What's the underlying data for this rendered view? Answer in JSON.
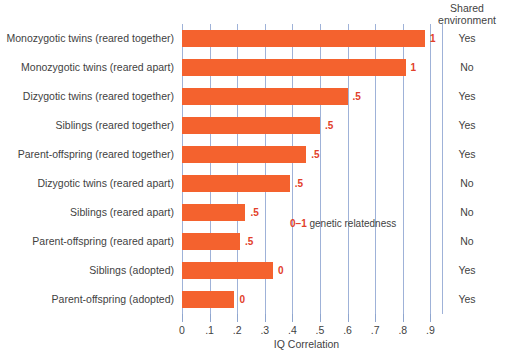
{
  "colors": {
    "bar": "#f4622e",
    "value_label": "#e2402a",
    "gridline": "#9fb2d8",
    "text": "#3f3f3f",
    "background": "#ffffff"
  },
  "header": {
    "shared_environment_label": "Shared\nenvironment",
    "shared_environment_line1": "Shared",
    "shared_environment_line2": "environment"
  },
  "annotation": {
    "prefix_num": "0",
    "dash": "–",
    "suffix_num": "1",
    "text": " genetic relatedness",
    "full": "0 –1 genetic relatedness"
  },
  "axis": {
    "x_title": "IQ Correlation",
    "x_ticks": [
      "0",
      ".1",
      ".2",
      ".3",
      ".4",
      ".5",
      ".6",
      ".7",
      ".8",
      ".9"
    ],
    "x_tick_values": [
      0,
      0.1,
      0.2,
      0.3,
      0.4,
      0.5,
      0.6,
      0.7,
      0.8,
      0.9
    ],
    "x_min": 0,
    "x_max": 0.9
  },
  "chart_data": {
    "type": "bar",
    "orientation": "horizontal",
    "title": "",
    "xlabel": "IQ Correlation",
    "ylabel": "",
    "xlim": [
      0,
      0.9
    ],
    "grid": true,
    "legend": null,
    "categories": [
      "Monozygotic twins (reared together)",
      "Monozygotic twins (reared apart)",
      "Dizygotic twins (reared together)",
      "Siblings (reared together)",
      "Parent-offspring (reared together)",
      "Dizygotic twins (reared apart)",
      "Siblings (reared apart)",
      "Parent-offspring (reared apart)",
      "Siblings (adopted)",
      "Parent-offspring (adopted)"
    ],
    "values": [
      0.88,
      0.81,
      0.6,
      0.5,
      0.45,
      0.39,
      0.23,
      0.21,
      0.33,
      0.19
    ],
    "point_labels": [
      "1",
      "1",
      ".5",
      ".5",
      ".5",
      ".5",
      ".5",
      ".5",
      "0",
      "0"
    ],
    "shared_environment": [
      "Yes",
      "No",
      "Yes",
      "Yes",
      "Yes",
      "No",
      "No",
      "No",
      "Yes",
      "Yes"
    ],
    "annotations": [
      "0 –1 genetic relatedness"
    ],
    "columns": [
      "Relationship",
      "IQ Correlation",
      "Genetic relatedness",
      "Shared environment"
    ]
  },
  "rows": [
    {
      "label": "Monozygotic twins (reared together)",
      "value": 0.88,
      "value_label": "1",
      "shared": "Yes"
    },
    {
      "label": "Monozygotic twins (reared apart)",
      "value": 0.81,
      "value_label": "1",
      "shared": "No"
    },
    {
      "label": "Dizygotic twins (reared together)",
      "value": 0.6,
      "value_label": ".5",
      "shared": "Yes"
    },
    {
      "label": "Siblings (reared together)",
      "value": 0.5,
      "value_label": ".5",
      "shared": "Yes"
    },
    {
      "label": "Parent-offspring (reared together)",
      "value": 0.45,
      "value_label": ".5",
      "shared": "Yes"
    },
    {
      "label": "Dizygotic twins (reared apart)",
      "value": 0.39,
      "value_label": ".5",
      "shared": "No"
    },
    {
      "label": "Siblings (reared apart)",
      "value": 0.23,
      "value_label": ".5",
      "shared": "No"
    },
    {
      "label": "Parent-offspring (reared apart)",
      "value": 0.21,
      "value_label": ".5",
      "shared": "No"
    },
    {
      "label": "Siblings (adopted)",
      "value": 0.33,
      "value_label": "0",
      "shared": "Yes"
    },
    {
      "label": "Parent-offspring (adopted)",
      "value": 0.19,
      "value_label": "0",
      "shared": "Yes"
    }
  ]
}
